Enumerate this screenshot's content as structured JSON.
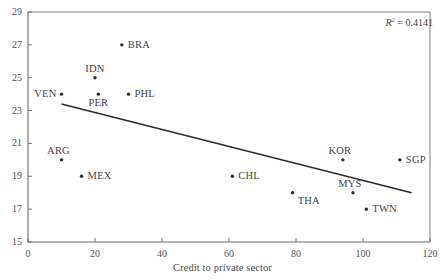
{
  "chart_data": {
    "type": "scatter",
    "title": "",
    "xlabel": "Credit to private sector",
    "ylabel": "",
    "xlim": [
      0,
      120
    ],
    "ylim": [
      15,
      29
    ],
    "xticks": [
      0,
      20,
      40,
      60,
      80,
      100,
      120
    ],
    "yticks": [
      15,
      17,
      19,
      21,
      23,
      25,
      27,
      29
    ],
    "grid": false,
    "legend": "none",
    "annotations": [
      {
        "name": "r-squared",
        "prefix": "R",
        "superscript": "2",
        "rest": " = 0.4141"
      }
    ],
    "points": [
      {
        "label": "VEN",
        "x": 10,
        "y": 24,
        "label_pos": "left"
      },
      {
        "label": "ARG",
        "x": 10,
        "y": 20,
        "label_pos": "above-left"
      },
      {
        "label": "MEX",
        "x": 16,
        "y": 19,
        "label_pos": "right"
      },
      {
        "label": "IDN",
        "x": 20,
        "y": 25,
        "label_pos": "above"
      },
      {
        "label": "PER",
        "x": 21,
        "y": 24,
        "label_pos": "below"
      },
      {
        "label": "BRA",
        "x": 28,
        "y": 27,
        "label_pos": "right"
      },
      {
        "label": "PHL",
        "x": 30,
        "y": 24,
        "label_pos": "right"
      },
      {
        "label": "CHL",
        "x": 61,
        "y": 19,
        "label_pos": "right"
      },
      {
        "label": "THA",
        "x": 79,
        "y": 18,
        "label_pos": "below-right"
      },
      {
        "label": "KOR",
        "x": 94,
        "y": 20,
        "label_pos": "above-left"
      },
      {
        "label": "MYS",
        "x": 97,
        "y": 18,
        "label_pos": "above-left"
      },
      {
        "label": "TWN",
        "x": 101,
        "y": 17,
        "label_pos": "right"
      },
      {
        "label": "SGP",
        "x": 111,
        "y": 20,
        "label_pos": "right"
      }
    ],
    "trendline": {
      "x1": 10,
      "y1": 23.4,
      "x2": 114.5,
      "y2": 18.0
    },
    "colors": {
      "axis": "#6d6c72",
      "marker": "#2c2b31",
      "trendline": "#2b2a30",
      "text": "#46454b"
    }
  }
}
